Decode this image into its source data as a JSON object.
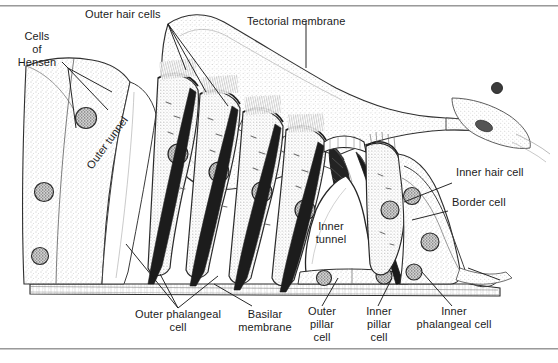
{
  "figure": {
    "background_color": "#ffffff",
    "ink_color": "#1b1b1b",
    "stipple_color": "#9d9d9d",
    "rule_color": "#9a9a9a",
    "width": 558,
    "height": 363
  },
  "labels": {
    "cells_of_hensen": "Cells\nof\nHensen",
    "outer_hair_cells": "Outer hair cells",
    "tectorial_membrane": "Tectorial membrane",
    "outer_tunnel": "Outer tunnel",
    "inner_hair_cell": "Inner hair cell",
    "border_cell": "Border cell",
    "inner_tunnel": "Inner\ntunnel",
    "outer_phalangeal_cell": "Outer phalangeal\ncell",
    "basilar_membrane": "Basilar\nmembrane",
    "outer_pillar_cell": "Outer\npillar\ncell",
    "inner_pillar_cell": "Inner\npillar\ncell",
    "inner_phalangeal_cell": "Inner\nphalangeal cell"
  },
  "structures": [
    {
      "name": "tectorial-membrane",
      "description": "Large stippled band arcing from upper-left across to the right, tapering at its right end near the inner hair cell region"
    },
    {
      "name": "hensen-cells",
      "description": "Large pale stippled cell block at the left of the figure with a round nucleus"
    },
    {
      "name": "outer-tunnel",
      "description": "Pale wedge-shaped space between the Hensen cells and the first outer hair cell column"
    },
    {
      "name": "outer-hair-cells",
      "description": "Row of four tall flask-shaped hair cells, each with stippled cytoplasm, a round nucleus and a tuft of stereocilia meeting the tectorial membrane"
    },
    {
      "name": "outer-phalangeal-cells",
      "description": "Slender supporting cells with dark basal processes running from the basilar membrane up between the outer hair cells"
    },
    {
      "name": "basilar-membrane",
      "description": "Horizontal fibrous band forming the floor of the organ of Corti"
    },
    {
      "name": "inner-tunnel",
      "description": "Large pale triangular space (tunnel of Corti) bounded by inner and outer pillar cells"
    },
    {
      "name": "outer-pillar-cell",
      "description": "Pillar cell forming the outer (left) wall of the inner tunnel, with a dark slender shaft"
    },
    {
      "name": "inner-pillar-cell",
      "description": "Pillar cell forming the inner (right) wall of the inner tunnel, with a dark slender shaft"
    },
    {
      "name": "inner-hair-cell",
      "description": "Single pear-shaped hair cell just inside the inner pillar cell, with stereocilia at its apex"
    },
    {
      "name": "inner-phalangeal-cell",
      "description": "Supporting cell wrapping the base of the inner hair cell"
    },
    {
      "name": "border-cell",
      "description": "Slender cell on the inner (right) side of the inner hair cell"
    }
  ],
  "leader_lines": [
    {
      "from": "cells_of_hensen",
      "to": "hensen-cells",
      "branches": 3
    },
    {
      "from": "outer_hair_cells",
      "to": "outer-hair-cells",
      "branches": 3
    },
    {
      "from": "tectorial_membrane",
      "to": "tectorial-membrane",
      "branches": 1
    },
    {
      "from": "inner_hair_cell",
      "to": "inner-hair-cell",
      "branches": 1
    },
    {
      "from": "border_cell",
      "to": "border-cell",
      "branches": 1
    },
    {
      "from": "outer_phalangeal_cell",
      "to": "outer-phalangeal-cells",
      "branches": 3
    },
    {
      "from": "basilar_membrane",
      "to": "basilar-membrane",
      "branches": 1
    },
    {
      "from": "outer_pillar_cell",
      "to": "outer-pillar-cell",
      "branches": 1
    },
    {
      "from": "inner_pillar_cell",
      "to": "inner-pillar-cell",
      "branches": 1
    },
    {
      "from": "inner_phalangeal_cell",
      "to": "inner-phalangeal-cell",
      "branches": 1
    }
  ]
}
